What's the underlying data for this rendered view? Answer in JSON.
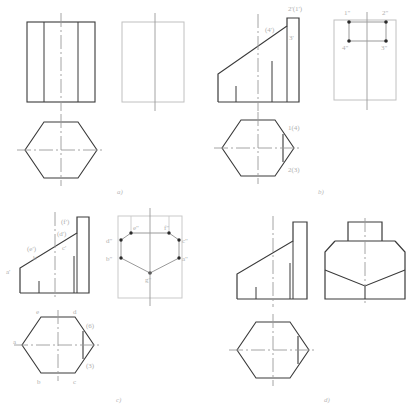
{
  "sheet": {
    "title": "Orthographic projection exercise: hexagonal prism truncated by an inclined plane",
    "background": "#ffffff",
    "line_color_solid": "#3a3a3a",
    "line_color_thin": "#8f8f8f",
    "line_color_faint": "#c9c9c9",
    "label_color": "#b0b0b0",
    "centerline_color": "#9a9a9a"
  },
  "panels": [
    {
      "id": "a",
      "caption": "a)",
      "description": "Given: front view (rectangle with two vertical edges) and empty side view outline; top view hexagon",
      "views": {
        "front": {
          "name": "front-view",
          "type": "rectangle-with-two-vertical-lines"
        },
        "side": {
          "name": "side-view",
          "type": "empty-rectangle"
        },
        "top": {
          "name": "top-view",
          "type": "hexagon"
        }
      },
      "labels": []
    },
    {
      "id": "b",
      "caption": "b)",
      "description": "Front view with inclined cut and point labels; side view rectangle with four marked points; top view hexagon with labelled vertices",
      "views": {
        "front": {
          "name": "front-view",
          "type": "truncated-prism-front"
        },
        "side": {
          "name": "side-view",
          "type": "rectangle-with-four-points"
        },
        "top": {
          "name": "top-view",
          "type": "hexagon-with-chord"
        }
      },
      "labels": [
        {
          "text": "2'(1')",
          "view": "front",
          "x": 84,
          "y": 9
        },
        {
          "text": "(4')",
          "view": "front",
          "x": 63,
          "y": 29
        },
        {
          "text": "3'",
          "view": "front",
          "x": 84,
          "y": 38
        },
        {
          "text": "1\"",
          "view": "side",
          "x": 139,
          "y": 10
        },
        {
          "text": "2\"",
          "view": "side",
          "x": 185,
          "y": 10
        },
        {
          "text": "4\"",
          "view": "side",
          "x": 137,
          "y": 41
        },
        {
          "text": "3\"",
          "view": "side",
          "x": 184,
          "y": 41
        },
        {
          "text": "1(4)",
          "view": "top",
          "x": 86,
          "y": 127
        },
        {
          "text": "2(3)",
          "view": "top",
          "x": 86,
          "y": 166
        }
      ]
    },
    {
      "id": "c",
      "caption": "c)",
      "description": "Front view with lettered points a' b' c' d' e' f'; side view hexagonal face with six marked points; top view hexagon with lettered vertices",
      "views": {
        "front": {
          "name": "front-view",
          "type": "truncated-prism-front"
        },
        "side": {
          "name": "side-view",
          "type": "hexagonal-face-with-six-points"
        },
        "top": {
          "name": "top-view",
          "type": "hexagon-with-chord"
        }
      },
      "labels": [
        {
          "text": "a'",
          "view": "front",
          "x": 8,
          "y": 70
        },
        {
          "text": "b'",
          "view": "front",
          "x": 34,
          "y": 56
        },
        {
          "text": "(e')",
          "view": "front",
          "x": 30,
          "y": 48
        },
        {
          "text": "(d')",
          "view": "front",
          "x": 60,
          "y": 33
        },
        {
          "text": "(f')",
          "view": "front",
          "x": 62,
          "y": 20
        },
        {
          "text": "c'",
          "view": "front",
          "x": 63,
          "y": 46
        },
        {
          "text": "d\"",
          "view": "side",
          "x": 113,
          "y": 40
        },
        {
          "text": "e\"",
          "view": "side",
          "x": 136,
          "y": 29
        },
        {
          "text": "f\"",
          "view": "side",
          "x": 168,
          "y": 29
        },
        {
          "text": "c\"",
          "view": "side",
          "x": 186,
          "y": 40
        },
        {
          "text": "b\"",
          "view": "side",
          "x": 112,
          "y": 58
        },
        {
          "text": "a\"",
          "view": "side",
          "x": 186,
          "y": 58
        },
        {
          "text": "g\"",
          "view": "side",
          "x": 150,
          "y": 73
        },
        {
          "text": "e",
          "view": "top",
          "x": 33,
          "y": 112
        },
        {
          "text": "d",
          "view": "top",
          "x": 71,
          "y": 112
        },
        {
          "text": "a",
          "view": "top",
          "x": 13,
          "y": 142
        },
        {
          "text": "(6)",
          "view": "top",
          "x": 84,
          "y": 128
        },
        {
          "text": "(3)",
          "view": "top",
          "x": 84,
          "y": 170
        },
        {
          "text": "b",
          "view": "top",
          "x": 35,
          "y": 182
        },
        {
          "text": "c",
          "view": "top",
          "x": 71,
          "y": 182
        }
      ]
    },
    {
      "id": "d",
      "caption": "d)",
      "description": "Completed solution: front view, side view with chamfered corners and V-line, top view hexagon",
      "views": {
        "front": {
          "name": "front-view",
          "type": "truncated-prism-front"
        },
        "side": {
          "name": "side-view",
          "type": "stepped-chamfered-outline"
        },
        "top": {
          "name": "top-view",
          "type": "hexagon-with-chord"
        }
      },
      "labels": []
    }
  ]
}
